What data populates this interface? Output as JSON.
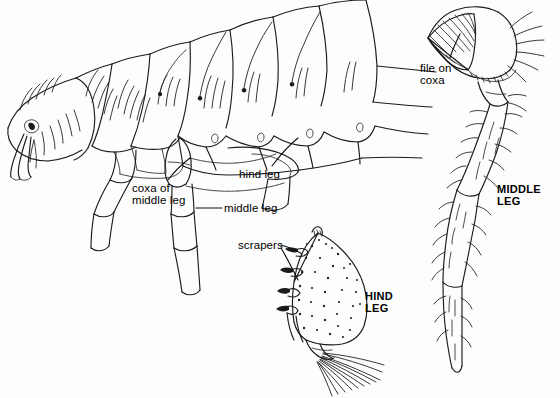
{
  "figure": {
    "background_color": "#fdfdfd",
    "ink_color": "#1b1b1b",
    "labels": {
      "hind_leg": "hind leg",
      "coxa_of_middle_leg": "coxa of\nmiddle leg",
      "middle_leg": "middle leg",
      "file_on_coxa": "file on\ncoxa",
      "scrapers": "scrapers"
    },
    "captions": {
      "middle_leg": "MIDDLE\nLEG",
      "hind_leg": "HIND\nLEG"
    },
    "parts": {
      "body": "flea-body-lateral-view",
      "middle_leg_detail": "middle-leg-with-file-on-coxa",
      "hind_leg_detail": "hind-leg-femur-with-scrapers"
    }
  }
}
